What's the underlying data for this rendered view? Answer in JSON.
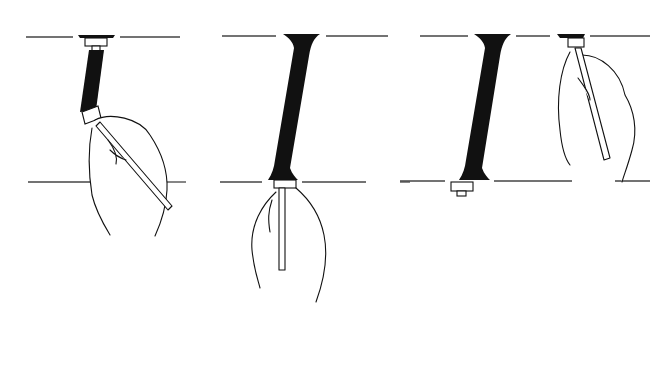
{
  "illustration": {
    "description": "Calligraphy demonstration: drawing a slanted letter I stroke with a broad-nib pen in three stages",
    "colors": {
      "ink": "#111111",
      "guide": "#444444",
      "background": "#ffffff"
    },
    "panels": [
      {
        "id": "stage-1",
        "caption": ""
      },
      {
        "id": "stage-2",
        "caption": ""
      },
      {
        "id": "stage-3",
        "caption": ""
      }
    ]
  }
}
